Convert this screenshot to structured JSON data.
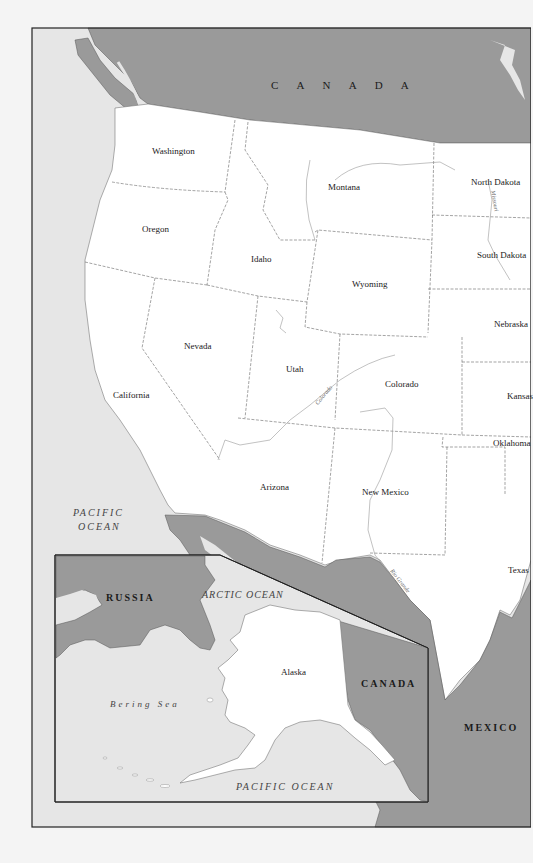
{
  "map": {
    "title": "Western United States and Alaska",
    "colors": {
      "ocean": "#e6e6e6",
      "us_land": "#ffffff",
      "foreign_land": "#9a9a9a",
      "frame": "#222222",
      "border": "#666666",
      "page": "#f4f4f4"
    },
    "countries": {
      "canada_main": "C A N A D A",
      "canada_inset": "CANADA",
      "russia": "RUSSIA",
      "mexico": "MEXICO"
    },
    "states": [
      {
        "name": "Washington"
      },
      {
        "name": "Oregon"
      },
      {
        "name": "California"
      },
      {
        "name": "Idaho"
      },
      {
        "name": "Nevada"
      },
      {
        "name": "Montana"
      },
      {
        "name": "Wyoming"
      },
      {
        "name": "Utah"
      },
      {
        "name": "Colorado"
      },
      {
        "name": "Arizona"
      },
      {
        "name": "New Mexico"
      },
      {
        "name": "North Dakota"
      },
      {
        "name": "South Dakota"
      },
      {
        "name": "Nebraska"
      },
      {
        "name": "Kansas"
      },
      {
        "name": "Oklahoma"
      },
      {
        "name": "Texas"
      },
      {
        "name": "Alaska"
      }
    ],
    "water_bodies": {
      "pacific_main_line1": "PACIFIC",
      "pacific_main_line2": "OCEAN",
      "arctic": "ARCTIC OCEAN",
      "bering": "Bering Sea",
      "pacific_inset": "PACIFIC OCEAN"
    },
    "rivers": {
      "missouri": "Missouri",
      "colorado": "Colorado",
      "rio_grande": "Rio Grande"
    },
    "inset": {
      "label": "Alaska inset"
    }
  }
}
